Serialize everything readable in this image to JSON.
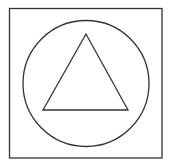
{
  "diagram": {
    "shapes": [
      {
        "type": "square",
        "x": 9.5,
        "y": 8.5,
        "width": 152.5,
        "height": 149.5
      },
      {
        "type": "circle",
        "cx": 86,
        "cy": 83.5,
        "r": 63
      },
      {
        "type": "triangle",
        "points": "86,34 43,110 128,110"
      }
    ],
    "stroke_color": "#333333",
    "background": "#ffffff"
  }
}
